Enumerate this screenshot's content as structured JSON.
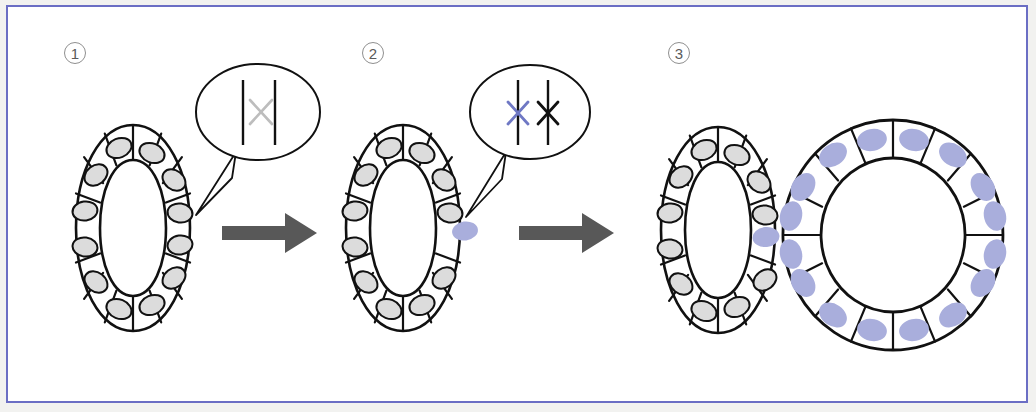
{
  "figure": {
    "frame_color": "#6b6ec4",
    "background_color": "#ffffff",
    "outer_margin_color": "#f2f2f0",
    "width": 1036,
    "height": 412
  },
  "palette": {
    "outline": "#111111",
    "nucleus_normal_fill": "#dcdcdc",
    "nucleus_mutant_fill": "#a9aedc",
    "arrow_color": "#585858",
    "callout_stroke": "#111111",
    "chromosome_black": "#111111",
    "chromosome_gray": "#bdbdbd",
    "chromosome_blue": "#6f78c4",
    "panel_number_text": "#5a5a5a",
    "panel_number_ring": "#8f8f8f"
  },
  "panels": [
    {
      "id": "panel-1",
      "number_label": "1",
      "caption": "Normal tissue ring; all nuclei unmutated",
      "ring": {
        "name": "normal-ring",
        "cell_count": 12,
        "mutant_cell_indices": [],
        "nucleus_fill": "#dcdcdc"
      },
      "callout": {
        "name": "chromosome-callout-1",
        "marks": [
          {
            "line": "left",
            "symbol": "none",
            "color": ""
          },
          {
            "line": "right",
            "symbol": "x",
            "color": "#bdbdbd"
          }
        ],
        "description": "Two homologous chromosomes; a faint gray X marks the not-yet-mutated allele"
      }
    },
    {
      "id": "panel-2",
      "number_label": "2",
      "caption": "A single cell acquires a mutation",
      "ring": {
        "name": "single-mutant-ring",
        "cell_count": 12,
        "mutant_cell_indices": [
          3
        ],
        "nucleus_fill": "#dcdcdc"
      },
      "callout": {
        "name": "chromosome-callout-2",
        "marks": [
          {
            "line": "left",
            "symbol": "x",
            "color": "#6f78c4"
          },
          {
            "line": "right",
            "symbol": "x",
            "color": "#111111"
          }
        ],
        "description": "Blue X on one chromosome and black X on the other indicate a mutated cell"
      }
    },
    {
      "id": "panel-3",
      "number_label": "3",
      "caption": "The mutant clone expands into a large, separate ring of mutant cells",
      "rings": [
        {
          "name": "residual-normal-ring",
          "cell_count": 12,
          "mutant_cell_indices": [
            3
          ],
          "nucleus_fill": "#dcdcdc",
          "size": "small"
        },
        {
          "name": "expanded-mutant-ring",
          "cell_count": 16,
          "mutant_cell_indices": "all",
          "nucleus_fill": "#a9aedc",
          "size": "large"
        }
      ]
    }
  ],
  "arrows": [
    {
      "name": "arrow-1-to-2",
      "direction": "right",
      "color": "#585858"
    },
    {
      "name": "arrow-2-to-3",
      "direction": "right",
      "color": "#585858"
    }
  ]
}
